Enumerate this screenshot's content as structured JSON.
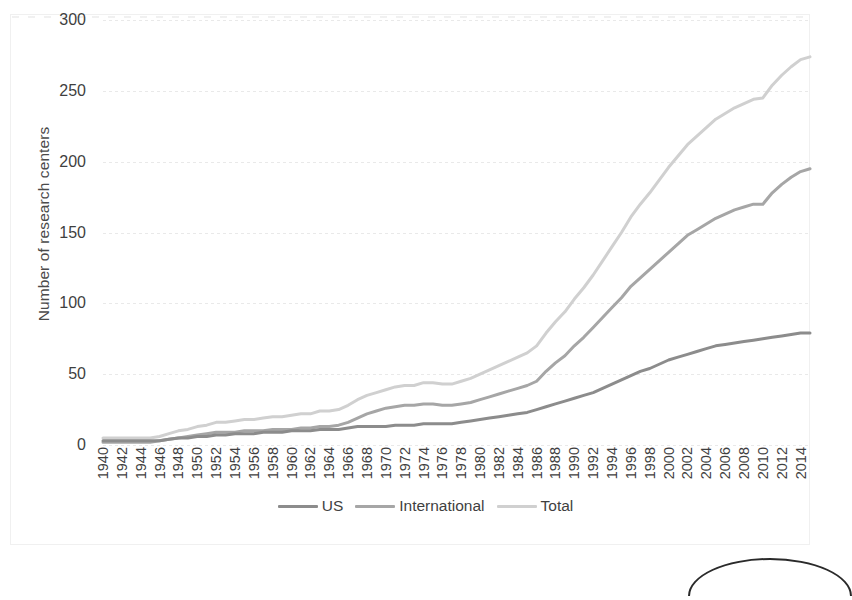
{
  "chart_data": {
    "type": "line",
    "title": "",
    "xlabel": "",
    "ylabel": "Number of research centers",
    "ylim": [
      0,
      300
    ],
    "yticks": [
      0,
      50,
      100,
      150,
      200,
      250,
      300
    ],
    "grid": true,
    "legend_position": "bottom",
    "x": [
      1940,
      1941,
      1942,
      1943,
      1944,
      1945,
      1946,
      1947,
      1948,
      1949,
      1950,
      1951,
      1952,
      1953,
      1954,
      1955,
      1956,
      1957,
      1958,
      1959,
      1960,
      1961,
      1962,
      1963,
      1964,
      1965,
      1966,
      1967,
      1968,
      1969,
      1970,
      1971,
      1972,
      1973,
      1974,
      1975,
      1976,
      1977,
      1978,
      1979,
      1980,
      1981,
      1982,
      1983,
      1984,
      1985,
      1986,
      1987,
      1988,
      1989,
      1990,
      1991,
      1992,
      1993,
      1994,
      1995,
      1996,
      1997,
      1998,
      1999,
      2000,
      2001,
      2002,
      2003,
      2004,
      2005,
      2006,
      2007,
      2008,
      2009,
      2010,
      2011,
      2012,
      2013,
      2014,
      2015
    ],
    "xtick_labels": [
      "1940",
      "1942",
      "1944",
      "1946",
      "1948",
      "1950",
      "1952",
      "1954",
      "1956",
      "1958",
      "1960",
      "1962",
      "1964",
      "1966",
      "1968",
      "1970",
      "1972",
      "1974",
      "1976",
      "1978",
      "1980",
      "1982",
      "1984",
      "1986",
      "1988",
      "1990",
      "1992",
      "1994",
      "1996",
      "1998",
      "2000",
      "2002",
      "2004",
      "2006",
      "2008",
      "2010",
      "2012",
      "2014"
    ],
    "xtick_step_years": 2,
    "series": [
      {
        "name": "US",
        "color": "#8c8c8c",
        "values": [
          3,
          3,
          3,
          3,
          3,
          3,
          3,
          4,
          5,
          5,
          6,
          6,
          7,
          7,
          8,
          8,
          8,
          9,
          9,
          9,
          10,
          10,
          10,
          11,
          11,
          11,
          12,
          13,
          13,
          13,
          13,
          14,
          14,
          14,
          15,
          15,
          15,
          15,
          16,
          17,
          18,
          19,
          20,
          21,
          22,
          23,
          25,
          27,
          29,
          31,
          33,
          35,
          37,
          40,
          43,
          46,
          49,
          52,
          54,
          57,
          60,
          62,
          64,
          66,
          68,
          70,
          71,
          72,
          73,
          74,
          75,
          76,
          77,
          78,
          79,
          79
        ]
      },
      {
        "name": "International",
        "color": "#a6a6a6",
        "values": [
          2,
          2,
          2,
          2,
          2,
          2,
          3,
          4,
          5,
          6,
          7,
          8,
          9,
          9,
          9,
          10,
          10,
          10,
          11,
          11,
          11,
          12,
          12,
          13,
          13,
          14,
          16,
          19,
          22,
          24,
          26,
          27,
          28,
          28,
          29,
          29,
          28,
          28,
          29,
          30,
          32,
          34,
          36,
          38,
          40,
          42,
          45,
          52,
          58,
          63,
          70,
          76,
          83,
          90,
          97,
          104,
          112,
          118,
          124,
          130,
          136,
          142,
          148,
          152,
          156,
          160,
          163,
          166,
          168,
          170,
          170,
          178,
          184,
          189,
          193,
          195
        ]
      },
      {
        "name": "Total",
        "color": "#d0d0d0",
        "values": [
          5,
          5,
          5,
          5,
          5,
          5,
          6,
          8,
          10,
          11,
          13,
          14,
          16,
          16,
          17,
          18,
          18,
          19,
          20,
          20,
          21,
          22,
          22,
          24,
          24,
          25,
          28,
          32,
          35,
          37,
          39,
          41,
          42,
          42,
          44,
          44,
          43,
          43,
          45,
          47,
          50,
          53,
          56,
          59,
          62,
          65,
          70,
          79,
          87,
          94,
          103,
          111,
          120,
          130,
          140,
          150,
          161,
          170,
          178,
          187,
          196,
          204,
          212,
          218,
          224,
          230,
          234,
          238,
          241,
          244,
          245,
          254,
          261,
          267,
          272,
          274
        ]
      }
    ]
  },
  "legend": {
    "items": [
      {
        "label": "US",
        "color": "#8c8c8c"
      },
      {
        "label": "International",
        "color": "#a6a6a6"
      },
      {
        "label": "Total",
        "color": "#d0d0d0"
      }
    ]
  }
}
